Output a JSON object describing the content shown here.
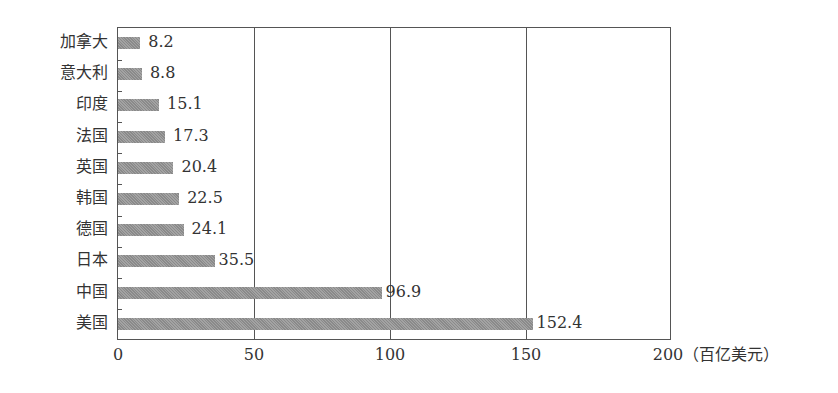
{
  "chart_data": {
    "type": "bar",
    "orientation": "horizontal",
    "title": "",
    "xlabel": "（百亿美元）",
    "ylabel": "",
    "xlim": [
      0,
      200
    ],
    "xticks": [
      "0",
      "50",
      "100",
      "150",
      "200"
    ],
    "grid": "vertical lines at 50, 100, 150",
    "categories": [
      "加拿大",
      "意大利",
      "印度",
      "法国",
      "英国",
      "韩国",
      "德国",
      "日本",
      "中国",
      "美国"
    ],
    "values": [
      8.2,
      8.8,
      15.1,
      17.3,
      20.4,
      22.5,
      24.1,
      35.5,
      96.9,
      152.4
    ],
    "value_labels": [
      "8.2",
      "8.8",
      "15.1",
      "17.3",
      "20.4",
      "22.5",
      "24.1",
      "35.5",
      "96.9",
      "152.4"
    ],
    "bar_color": "#999999"
  },
  "axis": {
    "x_ticks": [
      "0",
      "50",
      "100",
      "150",
      "200"
    ],
    "unit": "（百亿美元）"
  },
  "rows": [
    {
      "label": "加拿大",
      "value": "8.2"
    },
    {
      "label": "意大利",
      "value": "8.8"
    },
    {
      "label": "印度",
      "value": "15.1"
    },
    {
      "label": "法国",
      "value": "17.3"
    },
    {
      "label": "英国",
      "value": "20.4"
    },
    {
      "label": "韩国",
      "value": "22.5"
    },
    {
      "label": "德国",
      "value": "24.1"
    },
    {
      "label": "日本",
      "value": "35.5"
    },
    {
      "label": "中国",
      "value": "96.9"
    },
    {
      "label": "美国",
      "value": "152.4"
    }
  ]
}
